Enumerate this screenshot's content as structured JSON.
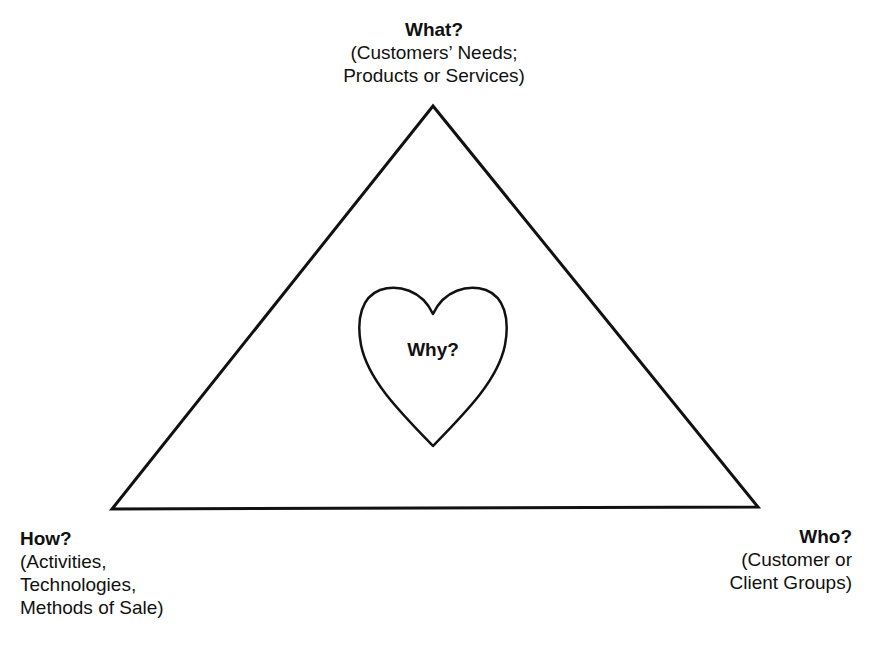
{
  "diagram": {
    "type": "triangle-with-heart",
    "colors": {
      "stroke": "#111111",
      "text": "#111111",
      "background": "#ffffff"
    },
    "nodes": {
      "what": {
        "heading": "What?",
        "lines": [
          "(Customers’ Needs;",
          "Products or Services)"
        ],
        "position": "top-vertex"
      },
      "how": {
        "heading": "How?",
        "lines": [
          "(Activities,",
          "Technologies,",
          "Methods of Sale)"
        ],
        "position": "bottom-left-vertex"
      },
      "who": {
        "heading": "Who?",
        "lines": [
          "(Customer or",
          "Client Groups)"
        ],
        "position": "bottom-right-vertex"
      },
      "why": {
        "heading": "Why?",
        "position": "center-heart"
      }
    }
  }
}
